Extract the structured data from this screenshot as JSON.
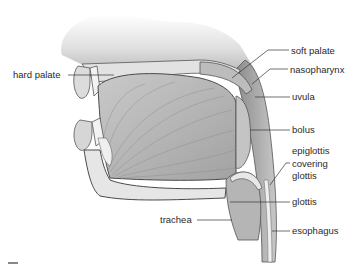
{
  "figure": {
    "palette": {
      "background": "#ffffff",
      "skin": "#d9d9d9",
      "tissue_light": "#e6e6e6",
      "tissue_mid": "#b8b8b8",
      "tissue_dark": "#6e6e6e",
      "outline": "#4a4a4a",
      "label_text": "#2a2a2a",
      "leader_line": "#333333"
    },
    "labels": [
      {
        "id": "hard-palate",
        "text": "hard palate",
        "x": 13,
        "y": 69
      },
      {
        "id": "soft-palate",
        "text": "soft palate",
        "x": 291,
        "y": 45
      },
      {
        "id": "nasopharynx",
        "text": "nasopharynx",
        "x": 290,
        "y": 64
      },
      {
        "id": "uvula",
        "text": "uvula",
        "x": 292,
        "y": 91
      },
      {
        "id": "bolus",
        "text": "bolus",
        "x": 292,
        "y": 124
      },
      {
        "id": "epiglottis-line1",
        "text": "epiglottis",
        "x": 292,
        "y": 145
      },
      {
        "id": "epiglottis-line2",
        "text": "covering",
        "x": 292,
        "y": 158
      },
      {
        "id": "epiglottis-line3",
        "text": "glottis",
        "x": 292,
        "y": 170
      },
      {
        "id": "glottis",
        "text": "glottis",
        "x": 292,
        "y": 196
      },
      {
        "id": "trachea",
        "text": "trachea",
        "x": 160,
        "y": 214
      },
      {
        "id": "esophagus",
        "text": "esophagus",
        "x": 292,
        "y": 225
      }
    ]
  }
}
